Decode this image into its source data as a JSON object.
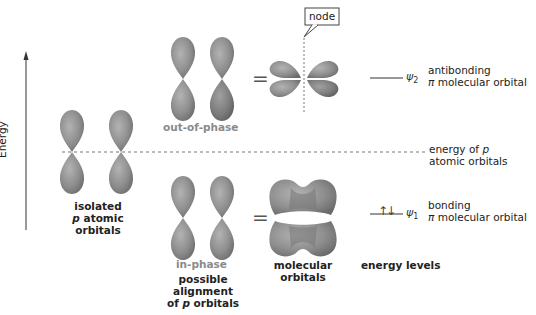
{
  "axis": {
    "label": "Energy"
  },
  "labels": {
    "node": "node",
    "out_of_phase": "out-of-phase",
    "in_phase": "in-phase",
    "isolated_line1": "isolated",
    "isolated_p": "p",
    "isolated_line2": " atomic orbitals",
    "possible_line1": "possible",
    "possible_line2": "alignment",
    "possible_line3a": "of ",
    "possible_p": "p",
    "possible_line3b": " orbitals",
    "molecular_line1": "molecular",
    "molecular_line2": "orbitals",
    "energy_levels": "energy levels",
    "equals_top": "=",
    "equals_bottom": "="
  },
  "levels": {
    "psi2": {
      "symbol": "ψ",
      "sub": "2",
      "desc1": "antibonding",
      "desc2_pi": "π",
      "desc2": " molecular orbital"
    },
    "p_energy": {
      "desc1a": "energy of ",
      "desc1_p": "p",
      "desc2": "atomic orbitals"
    },
    "psi1": {
      "symbol": "ψ",
      "sub": "1",
      "desc1": "bonding",
      "desc2_pi": "π",
      "desc2": " molecular orbital",
      "electrons": "↑↓"
    }
  },
  "colors": {
    "lobe": "#8c8c8c",
    "lobe_light": "#b5b5b5",
    "lobe_dark": "#6e6e6e",
    "dashed": "#777777"
  }
}
